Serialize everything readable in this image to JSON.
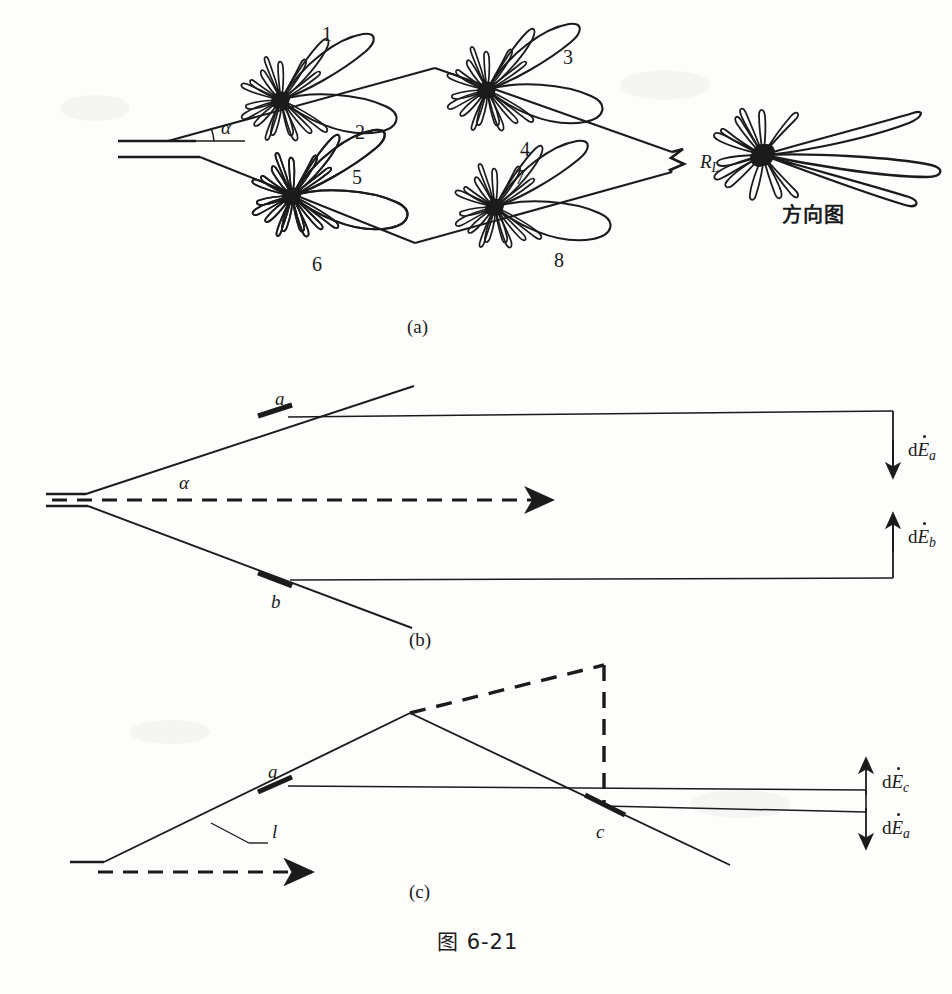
{
  "figure": {
    "caption": "图 6-21",
    "background_color": "#fdfdfc",
    "ink_color": "#1b1b1b"
  },
  "panels": [
    {
      "id": "a",
      "label": "(a)",
      "description": "rhombic antenna with four element radiation patterns, terminated in R_L, plus resulting pattern",
      "angle_label": "α",
      "lobe_numbers": [
        "1",
        "2",
        "3",
        "4",
        "5",
        "6",
        "7",
        "8"
      ],
      "termination_label": "R",
      "termination_sub": "L",
      "pattern_label": "方向图"
    },
    {
      "id": "b",
      "label": "(b)",
      "description": "two wires a and b with field contributions dE_a and dE_b",
      "angle_label": "α",
      "point_labels": [
        "a",
        "b"
      ],
      "field_labels": [
        {
          "prefix": "d",
          "symbol": "E",
          "sub": "a",
          "direction": "down"
        },
        {
          "prefix": "d",
          "symbol": "E",
          "sub": "b",
          "direction": "up"
        }
      ]
    },
    {
      "id": "c",
      "label": "(c)",
      "description": "wire segment l with points a and c and field contributions dE_c and dE_a",
      "point_labels": [
        "a",
        "c"
      ],
      "length_label": "l",
      "field_labels": [
        {
          "prefix": "d",
          "symbol": "E",
          "sub": "c",
          "direction": "up"
        },
        {
          "prefix": "d",
          "symbol": "E",
          "sub": "a",
          "direction": "down"
        }
      ]
    }
  ],
  "labels": {
    "alpha_a": "α",
    "alpha_b": "α",
    "n1": "1",
    "n2": "2",
    "n3": "3",
    "n4": "4",
    "n5": "5",
    "n6": "6",
    "n7": "7",
    "n8": "8",
    "rl_main": "R",
    "rl_sub": "L",
    "fangxiangtu": "方向图",
    "panel_a": "(a)",
    "panel_b": "(b)",
    "panel_c": "(c)",
    "pt_a_b": "a",
    "pt_b_b": "b",
    "pt_a_c": "a",
    "pt_c_c": "c",
    "len_l": "l",
    "d_rm": "d",
    "E_sym": "E",
    "sub_a": "a",
    "sub_b": "b",
    "sub_c": "c",
    "caption": "图 6-21"
  }
}
